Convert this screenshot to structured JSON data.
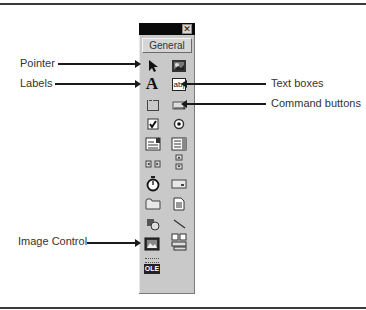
{
  "toolbox": {
    "close_glyph": "✕",
    "general_label": "General",
    "tools": [
      {
        "name": "pointer",
        "col": 0,
        "row": 0
      },
      {
        "name": "picture",
        "col": 1,
        "row": 0
      },
      {
        "name": "label",
        "col": 0,
        "row": 1,
        "glyph": "A"
      },
      {
        "name": "textbox",
        "col": 1,
        "row": 1,
        "glyph": "ab|"
      },
      {
        "name": "frame",
        "col": 0,
        "row": 2
      },
      {
        "name": "command-button",
        "col": 1,
        "row": 2
      },
      {
        "name": "checkbox",
        "col": 0,
        "row": 3
      },
      {
        "name": "option-button",
        "col": 1,
        "row": 3
      },
      {
        "name": "combobox",
        "col": 0,
        "row": 4
      },
      {
        "name": "listbox",
        "col": 1,
        "row": 4
      },
      {
        "name": "hscrollbar",
        "col": 0,
        "row": 5
      },
      {
        "name": "vscrollbar",
        "col": 1,
        "row": 5
      },
      {
        "name": "timer",
        "col": 0,
        "row": 6
      },
      {
        "name": "drive-listbox",
        "col": 1,
        "row": 6
      },
      {
        "name": "dir-listbox",
        "col": 0,
        "row": 7
      },
      {
        "name": "file-listbox",
        "col": 1,
        "row": 7
      },
      {
        "name": "shape",
        "col": 0,
        "row": 8
      },
      {
        "name": "line",
        "col": 1,
        "row": 8
      },
      {
        "name": "image",
        "col": 0,
        "row": 9
      },
      {
        "name": "data",
        "col": 1,
        "row": 9
      },
      {
        "name": "ole",
        "col": 0,
        "row": 10,
        "glyph": "OLE"
      }
    ]
  },
  "callouts": {
    "pointer": "Pointer",
    "labels": "Labels",
    "text_boxes": "Text boxes",
    "command_buttons": "Command buttons",
    "image_control": "Image Control"
  }
}
